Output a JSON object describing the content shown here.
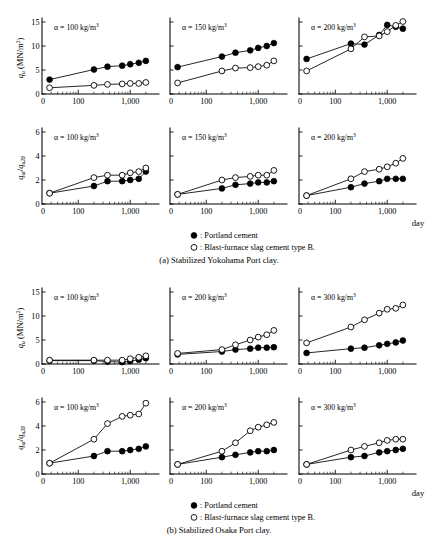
{
  "figure": {
    "title_visible": false,
    "background_color": "#ffffff",
    "ink_color": "#000000",
    "groups": [
      {
        "key": "a",
        "caption": "(a) Stabilized Yokohama Port clay."
      },
      {
        "key": "b",
        "caption": "(b) Stabilized Osaka Port clay."
      }
    ],
    "legend": {
      "filled_label": ": Portland cement",
      "open_label": ": Blast-furnace slag cement type B.",
      "filled_marker": "filled-circle-marker",
      "open_marker": "open-circle-marker"
    },
    "x_axis_caption": "day"
  },
  "axis_labels": {
    "qu_title_main": "q",
    "qu_title_sub": "u",
    "qu_title_unit": "(MN/m",
    "qu_title_unit_sup": "2",
    "qu_title_unit_close": ")",
    "ratio_num_main": "q",
    "ratio_num_sub": "ut",
    "ratio_slash": "/",
    "ratio_den_main": "q",
    "ratio_den_sub": "u28",
    "x_ticks": [
      "0",
      "100",
      "1,000"
    ],
    "y_ticks_qu": [
      "0",
      "5",
      "10",
      "15"
    ],
    "y_ticks_ratio": [
      "0",
      "2",
      "4",
      "6"
    ],
    "alpha_symbol": "α",
    "alpha_equals": " = ",
    "alpha_unit": " kg/m",
    "alpha_unit_sup": "3"
  },
  "chart_data": {
    "type": "line",
    "shared": {
      "xlabel": "day",
      "xscale": "log",
      "x_tick_values": [
        100,
        1000
      ],
      "x_range": [
        20,
        3000
      ],
      "grid": false,
      "legend_position": "below-figure",
      "series_names": [
        "Portland cement",
        "Blast-furnace slag cement type B."
      ]
    },
    "panels": [
      {
        "group": "a",
        "group_caption": "(a) Stabilized Yokohama Port clay.",
        "row": 1,
        "col": 1,
        "annotation": "α = 100 kg/m3",
        "alpha_value": 100,
        "ylabel": "qu (MN/m2)",
        "ylim": [
          0,
          15
        ],
        "y_ticks": [
          0,
          5,
          10,
          15
        ],
        "series": [
          {
            "name": "Portland cement",
            "marker": "filled",
            "x": [
              28,
              200,
              365,
              700,
              1000,
              1460,
              2000
            ],
            "y": [
              3.0,
              5.1,
              5.7,
              5.9,
              6.2,
              6.5,
              6.9
            ]
          },
          {
            "name": "Blast-furnace slag cement type B.",
            "marker": "open",
            "x": [
              28,
              200,
              365,
              700,
              1000,
              1460,
              2000
            ],
            "y": [
              1.3,
              1.8,
              2.0,
              2.1,
              2.2,
              2.2,
              2.4
            ]
          }
        ]
      },
      {
        "group": "a",
        "group_caption": "(a) Stabilized Yokohama Port clay.",
        "row": 1,
        "col": 2,
        "annotation": "α = 150 kg/m3",
        "alpha_value": 150,
        "ylabel": "qu (MN/m2)",
        "ylim": [
          0,
          15
        ],
        "y_ticks": [
          0,
          5,
          10,
          15
        ],
        "series": [
          {
            "name": "Portland cement",
            "marker": "filled",
            "x": [
              28,
              200,
              365,
              700,
              1000,
              1460,
              2000
            ],
            "y": [
              5.6,
              7.8,
              8.6,
              9.1,
              9.6,
              10.0,
              10.6
            ]
          },
          {
            "name": "Blast-furnace slag cement type B.",
            "marker": "open",
            "x": [
              28,
              200,
              365,
              700,
              1000,
              1460,
              2000
            ],
            "y": [
              2.3,
              4.8,
              5.4,
              5.5,
              5.7,
              6.0,
              6.9
            ]
          }
        ]
      },
      {
        "group": "a",
        "group_caption": "(a) Stabilized Yokohama Port clay.",
        "row": 1,
        "col": 3,
        "annotation": "α = 200 kg/m3",
        "alpha_value": 200,
        "ylabel": "qu (MN/m2)",
        "ylim": [
          0,
          15
        ],
        "y_ticks": [
          0,
          5,
          10,
          15
        ],
        "series": [
          {
            "name": "Portland cement",
            "marker": "filled",
            "x": [
              28,
              200,
              365,
              700,
              1000,
              1460,
              2000
            ],
            "y": [
              7.3,
              10.5,
              10.3,
              12.3,
              14.4,
              14.0,
              13.6
            ]
          },
          {
            "name": "Blast-furnace slag cement type B.",
            "marker": "open",
            "x": [
              28,
              200,
              365,
              700,
              1000,
              1460,
              2000
            ],
            "y": [
              4.8,
              9.4,
              11.9,
              12.1,
              13.0,
              14.3,
              15.1
            ]
          }
        ]
      },
      {
        "group": "a",
        "group_caption": "(a) Stabilized Yokohama Port clay.",
        "row": 2,
        "col": 1,
        "annotation": "α = 100 kg/m3",
        "alpha_value": 100,
        "ylabel": "qut/qu28",
        "ylim": [
          0,
          6
        ],
        "y_ticks": [
          0,
          2,
          4,
          6
        ],
        "series": [
          {
            "name": "Portland cement",
            "marker": "filled",
            "x": [
              28,
              200,
              365,
              700,
              1000,
              1460,
              2000
            ],
            "y": [
              0.9,
              1.5,
              1.9,
              1.9,
              2.0,
              2.1,
              2.7
            ]
          },
          {
            "name": "Blast-furnace slag cement type B.",
            "marker": "open",
            "x": [
              28,
              200,
              365,
              700,
              1000,
              1460,
              2000
            ],
            "y": [
              0.9,
              2.2,
              2.4,
              2.4,
              2.6,
              2.7,
              3.0
            ]
          }
        ]
      },
      {
        "group": "a",
        "group_caption": "(a) Stabilized Yokohama Port clay.",
        "row": 2,
        "col": 2,
        "annotation": "α = 150 kg/m3",
        "alpha_value": 150,
        "ylabel": "qut/qu28",
        "ylim": [
          0,
          6
        ],
        "y_ticks": [
          0,
          2,
          4,
          6
        ],
        "series": [
          {
            "name": "Portland cement",
            "marker": "filled",
            "x": [
              28,
              200,
              365,
              700,
              1000,
              1460,
              2000
            ],
            "y": [
              0.8,
              1.3,
              1.6,
              1.7,
              1.8,
              1.8,
              1.9
            ]
          },
          {
            "name": "Blast-furnace slag cement type B.",
            "marker": "open",
            "x": [
              28,
              200,
              365,
              700,
              1000,
              1460,
              2000
            ],
            "y": [
              0.8,
              2.0,
              2.2,
              2.3,
              2.4,
              2.4,
              2.8
            ]
          }
        ]
      },
      {
        "group": "a",
        "group_caption": "(a) Stabilized Yokohama Port clay.",
        "row": 2,
        "col": 3,
        "annotation": "α = 200 kg/m3",
        "alpha_value": 200,
        "ylabel": "qut/qu28",
        "ylim": [
          0,
          6
        ],
        "y_ticks": [
          0,
          2,
          4,
          6
        ],
        "series": [
          {
            "name": "Portland cement",
            "marker": "filled",
            "x": [
              28,
              200,
              365,
              700,
              1000,
              1460,
              2000
            ],
            "y": [
              0.7,
              1.4,
              1.7,
              1.9,
              2.1,
              2.1,
              2.1
            ]
          },
          {
            "name": "Blast-furnace slag cement type B.",
            "marker": "open",
            "x": [
              28,
              200,
              365,
              700,
              1000,
              1460,
              2000
            ],
            "y": [
              0.7,
              2.1,
              2.7,
              2.9,
              3.1,
              3.4,
              3.8
            ]
          }
        ]
      },
      {
        "group": "b",
        "group_caption": "(b) Stabilized Osaka Port clay.",
        "row": 1,
        "col": 1,
        "annotation": "α = 100 kg/m3",
        "alpha_value": 100,
        "ylabel": "qu (MN/m2)",
        "ylim": [
          0,
          15
        ],
        "y_ticks": [
          0,
          5,
          10,
          15
        ],
        "series": [
          {
            "name": "Portland cement",
            "marker": "filled",
            "x": [
              28,
              200,
              365,
              700,
              1000,
              1460,
              2000
            ],
            "y": [
              0.7,
              0.7,
              0.5,
              0.4,
              0.6,
              0.9,
              1.2
            ]
          },
          {
            "name": "Blast-furnace slag cement type B.",
            "marker": "open",
            "x": [
              28,
              200,
              365,
              700,
              1000,
              1460,
              2000
            ],
            "y": [
              0.8,
              0.8,
              0.8,
              0.8,
              1.1,
              1.4,
              1.7
            ]
          }
        ]
      },
      {
        "group": "b",
        "group_caption": "(b) Stabilized Osaka Port clay.",
        "row": 1,
        "col": 2,
        "annotation": "α = 200 kg/m3",
        "alpha_value": 200,
        "ylabel": "qu (MN/m2)",
        "ylim": [
          0,
          15
        ],
        "y_ticks": [
          0,
          5,
          10,
          15
        ],
        "series": [
          {
            "name": "Portland cement",
            "marker": "filled",
            "x": [
              28,
              200,
              365,
              700,
              1000,
              1460,
              2000
            ],
            "y": [
              2.0,
              2.6,
              3.0,
              3.2,
              3.4,
              3.4,
              3.5
            ]
          },
          {
            "name": "Blast-furnace slag cement type B.",
            "marker": "open",
            "x": [
              28,
              200,
              365,
              700,
              1000,
              1460,
              2000
            ],
            "y": [
              2.2,
              3.0,
              4.0,
              5.0,
              5.6,
              6.1,
              7.0
            ]
          }
        ]
      },
      {
        "group": "b",
        "group_caption": "(b) Stabilized Osaka Port clay.",
        "row": 1,
        "col": 3,
        "annotation": "α = 300 kg/m3",
        "alpha_value": 300,
        "ylabel": "qu (MN/m2)",
        "ylim": [
          0,
          15
        ],
        "y_ticks": [
          0,
          5,
          10,
          15
        ],
        "series": [
          {
            "name": "Portland cement",
            "marker": "filled",
            "x": [
              28,
              200,
              365,
              700,
              1000,
              1460,
              2000
            ],
            "y": [
              2.3,
              3.2,
              3.4,
              3.9,
              4.2,
              4.5,
              4.9
            ]
          },
          {
            "name": "Blast-furnace slag cement type B.",
            "marker": "open",
            "x": [
              28,
              200,
              365,
              700,
              1000,
              1460,
              2000
            ],
            "y": [
              4.4,
              7.7,
              9.2,
              10.6,
              11.4,
              11.6,
              12.3
            ]
          }
        ]
      },
      {
        "group": "b",
        "group_caption": "(b) Stabilized Osaka Port clay.",
        "row": 2,
        "col": 1,
        "annotation": "α = 100 kg/m3",
        "alpha_value": 100,
        "ylabel": "qut/qu28",
        "ylim": [
          0,
          6
        ],
        "y_ticks": [
          0,
          2,
          4,
          6
        ],
        "series": [
          {
            "name": "Portland cement",
            "marker": "filled",
            "x": [
              28,
              200,
              365,
              700,
              1000,
              1460,
              2000
            ],
            "y": [
              0.9,
              1.5,
              1.9,
              1.9,
              2.0,
              2.1,
              2.3
            ]
          },
          {
            "name": "Blast-furnace slag cement type B.",
            "marker": "open",
            "x": [
              28,
              200,
              365,
              700,
              1000,
              1460,
              2000
            ],
            "y": [
              0.9,
              2.9,
              4.2,
              4.8,
              4.9,
              5.0,
              5.9
            ]
          }
        ]
      },
      {
        "group": "b",
        "group_caption": "(b) Stabilized Osaka Port clay.",
        "row": 2,
        "col": 2,
        "annotation": "α = 200 kg/m3",
        "alpha_value": 200,
        "ylabel": "qut/qu28",
        "ylim": [
          0,
          6
        ],
        "y_ticks": [
          0,
          2,
          4,
          6
        ],
        "series": [
          {
            "name": "Portland cement",
            "marker": "filled",
            "x": [
              28,
              200,
              365,
              700,
              1000,
              1460,
              2000
            ],
            "y": [
              0.8,
              1.4,
              1.6,
              1.8,
              1.9,
              1.9,
              2.0
            ]
          },
          {
            "name": "Blast-furnace slag cement type B.",
            "marker": "open",
            "x": [
              28,
              200,
              365,
              700,
              1000,
              1460,
              2000
            ],
            "y": [
              0.8,
              1.9,
              2.6,
              3.6,
              3.9,
              4.1,
              4.3
            ]
          }
        ]
      },
      {
        "group": "b",
        "group_caption": "(b) Stabilized Osaka Port clay.",
        "row": 2,
        "col": 3,
        "annotation": "α = 300 kg/m3",
        "alpha_value": 300,
        "ylabel": "qut/qu28",
        "ylim": [
          0,
          6
        ],
        "y_ticks": [
          0,
          2,
          4,
          6
        ],
        "series": [
          {
            "name": "Portland cement",
            "marker": "filled",
            "x": [
              28,
              200,
              365,
              700,
              1000,
              1460,
              2000
            ],
            "y": [
              0.8,
              1.4,
              1.5,
              1.8,
              1.9,
              2.0,
              2.1
            ]
          },
          {
            "name": "Blast-furnace slag cement type B.",
            "marker": "open",
            "x": [
              28,
              200,
              365,
              700,
              1000,
              1460,
              2000
            ],
            "y": [
              0.8,
              2.0,
              2.3,
              2.6,
              2.8,
              2.9,
              2.9
            ]
          }
        ]
      }
    ]
  }
}
